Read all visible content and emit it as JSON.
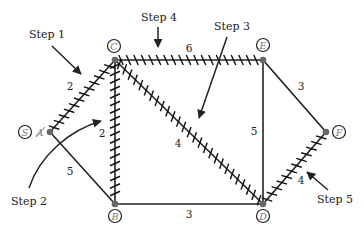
{
  "diagram": {
    "type": "weighted-graph-shortest-path",
    "nodes": [
      {
        "id": "S",
        "label": "S",
        "x": 25,
        "y": 132
      },
      {
        "id": "A",
        "label": "A",
        "x": 50,
        "y": 132,
        "crossed_out": true
      },
      {
        "id": "C",
        "label": "C",
        "x": 115,
        "y": 60
      },
      {
        "id": "E",
        "label": "E",
        "x": 263,
        "y": 60
      },
      {
        "id": "B",
        "label": "B",
        "x": 115,
        "y": 204
      },
      {
        "id": "D",
        "label": "D",
        "x": 263,
        "y": 204
      },
      {
        "id": "F",
        "label": "F",
        "x": 326,
        "y": 132
      }
    ],
    "edges": [
      {
        "from": "A",
        "to": "C",
        "weight": "2",
        "hatched": true
      },
      {
        "from": "A",
        "to": "B",
        "weight": "5",
        "hatched": false
      },
      {
        "from": "C",
        "to": "B",
        "weight": "2",
        "hatched": true
      },
      {
        "from": "C",
        "to": "E",
        "weight": "6",
        "hatched": true
      },
      {
        "from": "C",
        "to": "D",
        "weight": "4",
        "hatched": true
      },
      {
        "from": "E",
        "to": "D",
        "weight": "5",
        "hatched": false
      },
      {
        "from": "E",
        "to": "F",
        "weight": "3",
        "hatched": false
      },
      {
        "from": "B",
        "to": "D",
        "weight": "3",
        "hatched": false
      },
      {
        "from": "D",
        "to": "F",
        "weight": "4",
        "hatched": true
      }
    ],
    "steps": [
      {
        "label": "Step 1",
        "target_edge": "A-C"
      },
      {
        "label": "Step 2",
        "target_edge": "C-B"
      },
      {
        "label": "Step 3",
        "target_edge": "C-D"
      },
      {
        "label": "Step 4",
        "target_edge": "C-E"
      },
      {
        "label": "Step 5",
        "target_edge": "D-F"
      }
    ]
  },
  "labels": {
    "S": "S",
    "A": "A",
    "C": "C",
    "E": "E",
    "B": "B",
    "D": "D",
    "F": "F",
    "w_AC": "2",
    "w_AB": "5",
    "w_CB": "2",
    "w_CE": "6",
    "w_CD": "4",
    "w_ED": "5",
    "w_EF": "3",
    "w_BD": "3",
    "w_DF": "4",
    "step1": "Step 1",
    "step2": "Step 2",
    "step3": "Step 3",
    "step4": "Step 4",
    "step5": "Step 5"
  }
}
